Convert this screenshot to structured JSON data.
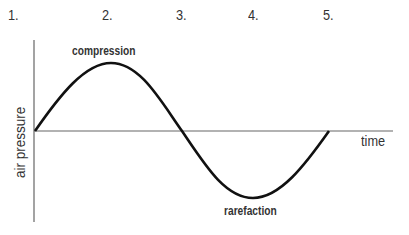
{
  "numbers": [
    "1.",
    "2.",
    "3.",
    "4.",
    "5."
  ],
  "labels": {
    "compression": "compression",
    "rarefaction": "rarefaction",
    "x_axis": "time",
    "y_axis": "air pressure"
  },
  "colors": {
    "curve": "#111111",
    "axis": "#666666",
    "text": "#333333"
  }
}
